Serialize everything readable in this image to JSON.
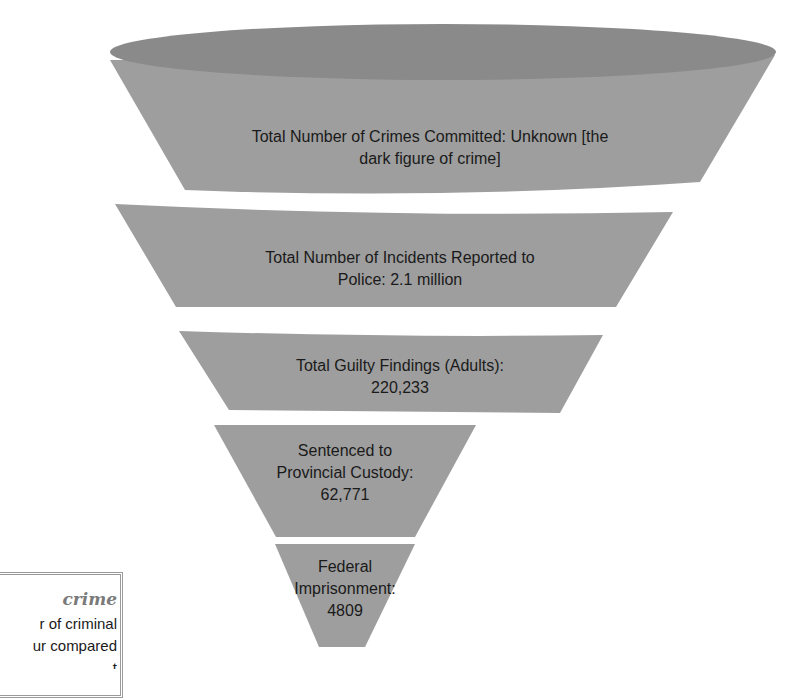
{
  "diagram": {
    "type": "funnel",
    "colors": {
      "fill": "#9e9e9e",
      "top_ellipse": "#8a8a8a",
      "text": "#1a1a1a",
      "background": "#ffffff"
    },
    "stages": [
      {
        "line1": "Total Number of Crimes Committed: Unknown [the",
        "line2": "dark figure of crime]",
        "line3": ""
      },
      {
        "line1": "Total Number of Incidents Reported to",
        "line2": "Police: 2.1 million",
        "line3": ""
      },
      {
        "line1": "Total Guilty Findings (Adults):",
        "line2": "220,233",
        "line3": ""
      },
      {
        "line1": "Sentenced to",
        "line2": "Provincial Custody:",
        "line3": "62,771"
      },
      {
        "line1": "Federal",
        "line2": "Imprisonment:",
        "line3": "4809"
      }
    ]
  },
  "sidebox": {
    "term": "crime",
    "def_line1": "r of criminal",
    "def_line2": "ur compared",
    "def_line3": "t"
  }
}
